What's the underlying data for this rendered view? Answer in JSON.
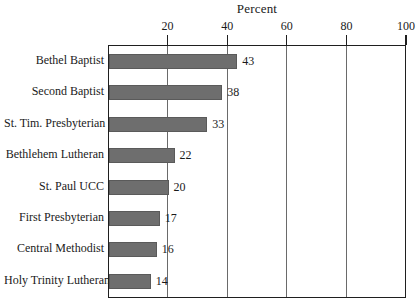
{
  "chart_data": {
    "type": "bar",
    "orientation": "horizontal",
    "title": "Percent",
    "xlabel": "",
    "ylabel": "",
    "xlim": [
      0,
      100
    ],
    "grid": true,
    "legend": false,
    "categories": [
      "Bethel Baptist",
      "Second Baptist",
      "St. Tim. Presbyterian",
      "Bethlehem Lutheran",
      "St. Paul UCC",
      "First Presbyterian",
      "Central Methodist",
      "Holy Trinity Lutheran"
    ],
    "values": [
      43,
      38,
      33,
      22,
      20,
      17,
      16,
      14
    ],
    "value_labels": [
      "43",
      "38",
      "33",
      "22",
      "20",
      "17",
      "16",
      "14"
    ],
    "xticks": [
      20,
      40,
      60,
      80,
      100
    ],
    "xtick_labels": [
      "20",
      "40",
      "60",
      "80",
      "100"
    ],
    "bar_color": "#6e6e6e",
    "axis_color": "#1f1f1f",
    "grid_color": "#6a6a6a",
    "background": "#ffffff"
  }
}
